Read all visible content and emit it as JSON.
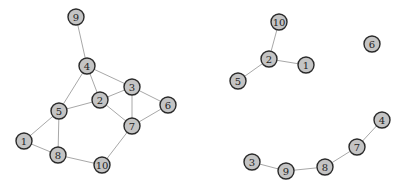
{
  "graphs": [
    {
      "name": "left-graph",
      "nodes": [
        {
          "id": "1",
          "x": 24,
          "y": 141
        },
        {
          "id": "2",
          "x": 100,
          "y": 100
        },
        {
          "id": "3",
          "x": 132,
          "y": 87
        },
        {
          "id": "4",
          "x": 87,
          "y": 66
        },
        {
          "id": "5",
          "x": 59,
          "y": 111
        },
        {
          "id": "6",
          "x": 168,
          "y": 105
        },
        {
          "id": "7",
          "x": 132,
          "y": 126
        },
        {
          "id": "8",
          "x": 58,
          "y": 155
        },
        {
          "id": "9",
          "x": 76,
          "y": 17
        },
        {
          "id": "10",
          "x": 102,
          "y": 165
        }
      ],
      "edges": [
        [
          "9",
          "4"
        ],
        [
          "4",
          "3"
        ],
        [
          "4",
          "2"
        ],
        [
          "4",
          "5"
        ],
        [
          "3",
          "2"
        ],
        [
          "3",
          "7"
        ],
        [
          "3",
          "6"
        ],
        [
          "2",
          "5"
        ],
        [
          "2",
          "7"
        ],
        [
          "6",
          "7"
        ],
        [
          "5",
          "1"
        ],
        [
          "5",
          "8"
        ],
        [
          "1",
          "8"
        ],
        [
          "8",
          "10"
        ],
        [
          "7",
          "10"
        ]
      ]
    },
    {
      "name": "right-graph",
      "nodes": [
        {
          "id": "10",
          "x": 279,
          "y": 22
        },
        {
          "id": "6",
          "x": 372,
          "y": 44
        },
        {
          "id": "2",
          "x": 269,
          "y": 59
        },
        {
          "id": "1",
          "x": 306,
          "y": 65
        },
        {
          "id": "5",
          "x": 238,
          "y": 81
        },
        {
          "id": "4",
          "x": 382,
          "y": 120
        },
        {
          "id": "7",
          "x": 357,
          "y": 147
        },
        {
          "id": "3",
          "x": 252,
          "y": 162
        },
        {
          "id": "9",
          "x": 286,
          "y": 171
        },
        {
          "id": "8",
          "x": 325,
          "y": 167
        }
      ],
      "edges": [
        [
          "10",
          "2"
        ],
        [
          "2",
          "1"
        ],
        [
          "2",
          "5"
        ],
        [
          "4",
          "7"
        ],
        [
          "7",
          "8"
        ],
        [
          "8",
          "9"
        ],
        [
          "9",
          "3"
        ]
      ]
    }
  ],
  "style": {
    "node_fill": "#c4c4c4",
    "node_stroke": "#2a2a2a",
    "edge_color": "#a8a8a8",
    "node_radius": 8
  }
}
